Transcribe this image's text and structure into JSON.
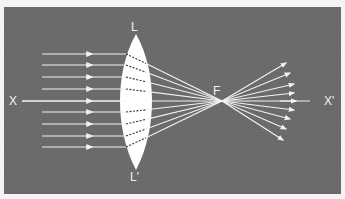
{
  "diagram": {
    "labels": {
      "lens_top": "L",
      "lens_bottom": "L'",
      "focus": "F",
      "axis_left": "X",
      "axis_right": "X'"
    },
    "colors": {
      "background": "#6a6a6a",
      "rays": "#f2f2f2",
      "lens": "#ffffff",
      "frame": "#f4f4f4"
    },
    "rays": {
      "count": 9,
      "incident_y": [
        54,
        65,
        77,
        89,
        101,
        112,
        124,
        136,
        147
      ],
      "lens_x": 128,
      "focus": [
        222,
        101
      ],
      "exit_tips": [
        [
          286,
          63
        ],
        [
          290,
          73
        ],
        [
          294,
          84
        ],
        [
          294,
          93
        ],
        [
          310,
          101
        ],
        [
          294,
          110
        ],
        [
          290,
          119
        ],
        [
          286,
          129
        ],
        [
          283,
          140
        ]
      ]
    }
  }
}
